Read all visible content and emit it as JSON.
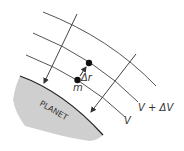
{
  "diagram": {
    "planet_label": "PLANET",
    "mass_label": "m",
    "displacement_label": "Δr",
    "equipotentials": [
      {
        "id": "outer",
        "label": ""
      },
      {
        "id": "upper",
        "label": "V + ΔV"
      },
      {
        "id": "lower",
        "label": "V"
      }
    ],
    "colors": {
      "line": "#555555",
      "planet_fill": "#cfcfcf",
      "planet_edge": "#222222",
      "dot": "#111111",
      "text": "#333333"
    }
  }
}
